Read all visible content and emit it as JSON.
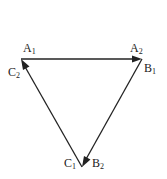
{
  "diagram": {
    "type": "directed-triangle",
    "colors": {
      "stroke": "#222222",
      "background": "#ffffff"
    },
    "vertices": {
      "top_left": {
        "x": 21,
        "y": 59
      },
      "top_right": {
        "x": 142,
        "y": 59
      },
      "bottom": {
        "x": 82,
        "y": 167
      }
    },
    "edges": [
      {
        "from": "top_left",
        "to": "top_right",
        "arrow_at": "top_right"
      },
      {
        "from": "top_right",
        "to": "bottom",
        "arrow_at": "bottom"
      },
      {
        "from": "bottom",
        "to": "top_left",
        "arrow_at": "top_left"
      }
    ],
    "labels": {
      "A1": {
        "base": "A",
        "sub": "1"
      },
      "A2": {
        "base": "A",
        "sub": "2"
      },
      "B1": {
        "base": "B",
        "sub": "1"
      },
      "B2": {
        "base": "B",
        "sub": "2"
      },
      "C1": {
        "base": "C",
        "sub": "1"
      },
      "C2": {
        "base": "C",
        "sub": "2"
      }
    }
  }
}
